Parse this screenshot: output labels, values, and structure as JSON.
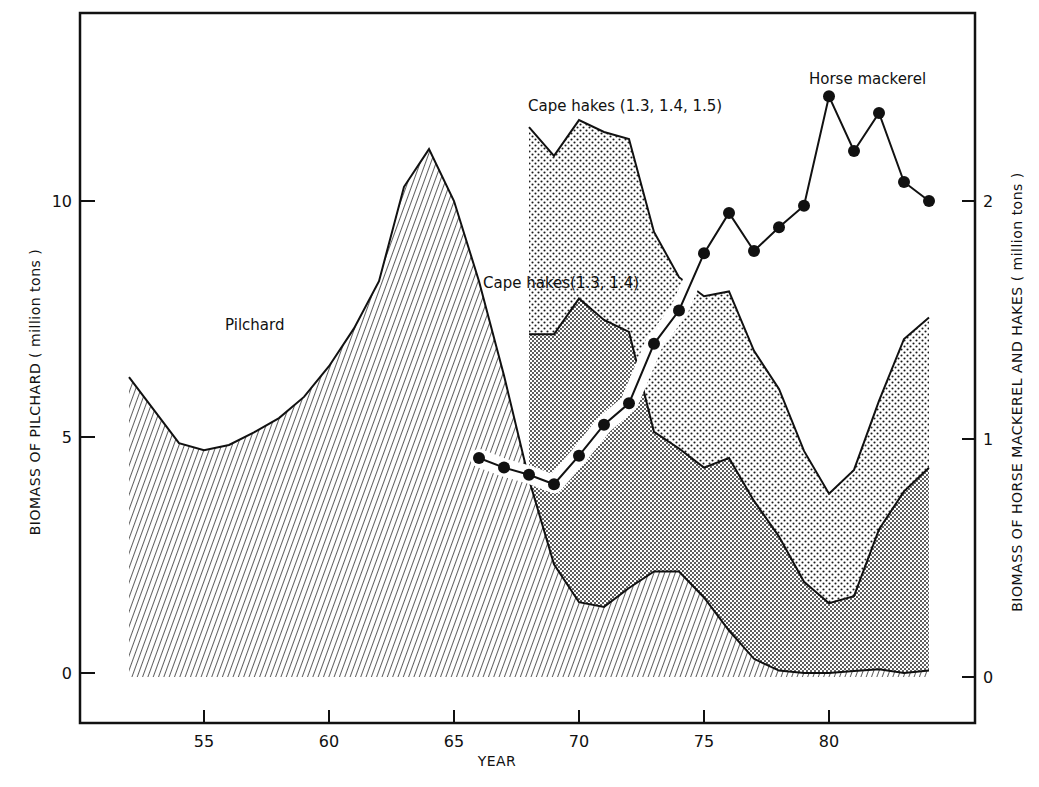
{
  "chart_data": {
    "type": "area",
    "title": "",
    "xlabel": "YEAR",
    "ylabel_left": "BIOMASS OF PILCHARD ( million tons )",
    "ylabel_right": "BIOMASS OF HORSE MACKEREL AND HAKES ( million tons )",
    "x_ticks": [
      55,
      60,
      65,
      70,
      75,
      80
    ],
    "y_left_ticks": [
      0,
      5,
      10
    ],
    "y_right_ticks": [
      0,
      1,
      2
    ],
    "xlim": [
      50.0,
      87.5
    ],
    "ylim_left": [
      -1.05,
      13.97
    ],
    "ylim_right": [
      -0.19,
      2.79
    ],
    "grid": false,
    "annotations": [
      {
        "text": "Pilchard",
        "x": 58.2,
        "y_left": 7.4
      },
      {
        "text": "Cape hakes (1.3, 1.4, 1.5)",
        "x": 68.0,
        "y_right": 2.39
      },
      {
        "text": "Cape hakes(1.3, 1.4)",
        "x": 66.0,
        "y_right": 1.65
      },
      {
        "text": "Horse mackerel",
        "x": 77.7,
        "y_right": 2.5
      }
    ],
    "series": [
      {
        "name": "Pilchard",
        "axis": "left",
        "style": "hatched-area",
        "x": [
          52,
          54,
          55,
          56,
          57,
          58,
          59,
          60,
          61,
          62,
          63,
          64,
          65,
          66,
          67,
          68,
          69,
          70,
          71,
          72,
          73,
          74,
          75,
          76,
          77,
          78,
          79,
          80,
          81,
          82,
          83,
          84
        ],
        "values": [
          6.27,
          4.87,
          4.72,
          4.83,
          5.1,
          5.4,
          5.85,
          6.5,
          7.3,
          8.3,
          10.3,
          11.1,
          10.0,
          8.3,
          6.3,
          4.1,
          2.3,
          1.5,
          1.4,
          1.8,
          2.15,
          2.15,
          1.6,
          0.9,
          0.3,
          0.05,
          0.0,
          0.0,
          0.04,
          0.08,
          0.0,
          0.05
        ]
      },
      {
        "name": "Cape hakes (1.3, 1.4)",
        "axis": "right",
        "style": "dense-dot-area",
        "x": [
          68,
          69,
          70,
          71,
          72,
          73,
          74,
          75,
          76,
          77,
          78,
          79,
          80,
          81,
          82,
          83,
          84
        ],
        "values": [
          1.44,
          1.44,
          1.59,
          1.5,
          1.45,
          1.03,
          0.96,
          0.88,
          0.92,
          0.74,
          0.59,
          0.4,
          0.31,
          0.34,
          0.62,
          0.78,
          0.88
        ]
      },
      {
        "name": "Cape hakes (1.3, 1.4, 1.5)",
        "axis": "right",
        "style": "light-dot-area",
        "x": [
          68,
          69,
          70,
          71,
          72,
          73,
          74,
          75,
          76,
          77,
          78,
          79,
          80,
          81,
          82,
          83,
          84
        ],
        "values": [
          2.31,
          2.19,
          2.34,
          2.29,
          2.26,
          1.87,
          1.68,
          1.6,
          1.62,
          1.37,
          1.21,
          0.95,
          0.77,
          0.87,
          1.16,
          1.42,
          1.51
        ]
      },
      {
        "name": "Horse mackerel",
        "axis": "right",
        "style": "line-markers",
        "x": [
          66,
          67,
          68,
          69,
          70,
          71,
          72,
          73,
          74,
          75,
          76,
          77,
          78,
          79,
          80,
          81,
          82,
          83,
          84
        ],
        "values": [
          0.92,
          0.88,
          0.85,
          0.81,
          0.93,
          1.06,
          1.15,
          1.4,
          1.54,
          1.78,
          1.95,
          1.79,
          1.89,
          1.98,
          2.44,
          2.21,
          2.37,
          2.08,
          2.0
        ]
      }
    ]
  }
}
